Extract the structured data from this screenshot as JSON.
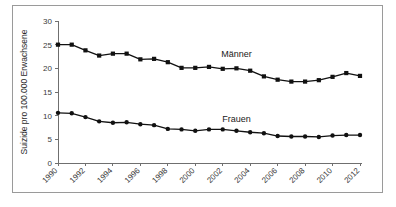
{
  "figure": {
    "background_color": "#ffffff",
    "frame_color": "#9a9a9a",
    "series_color": "#111111"
  },
  "chart_data": {
    "type": "line",
    "title": "",
    "subtitle": "",
    "xlabel": "",
    "ylabel": "Suizide pro 100.000 Erwachsene",
    "ylim": [
      0,
      30
    ],
    "yticks": [
      0,
      5,
      10,
      15,
      20,
      25,
      30
    ],
    "ytick_labels": [
      "0",
      "5",
      "10",
      "15",
      "20",
      "25",
      "30"
    ],
    "grid": false,
    "legend_position": "inline-annotation",
    "x": [
      1990,
      1991,
      1992,
      1993,
      1994,
      1995,
      1996,
      1997,
      1998,
      1999,
      2000,
      2001,
      2002,
      2003,
      2004,
      2005,
      2006,
      2007,
      2008,
      2009,
      2010,
      2011,
      2012
    ],
    "xtick_values": [
      1990,
      1992,
      1994,
      1996,
      1998,
      2000,
      2002,
      2004,
      2006,
      2008,
      2010,
      2012
    ],
    "xtick_labels": [
      "1990",
      "1992",
      "1994",
      "1996",
      "1998",
      "2000",
      "2002",
      "2004",
      "2006",
      "2008",
      "2010",
      "2012"
    ],
    "xlim": [
      1990,
      2012
    ],
    "series": [
      {
        "name": "Männer",
        "label": "Männer",
        "marker": "square",
        "color": "#111111",
        "annotation": "Männer",
        "values": [
          25.0,
          25.0,
          23.8,
          22.7,
          23.1,
          23.1,
          21.9,
          22.0,
          21.3,
          20.1,
          20.1,
          20.3,
          19.9,
          20.0,
          19.5,
          18.3,
          17.6,
          17.2,
          17.2,
          17.5,
          18.2,
          19.0,
          18.4
        ]
      },
      {
        "name": "Frauen",
        "label": "Frauen",
        "marker": "circle",
        "color": "#111111",
        "annotation": "Frauen",
        "values": [
          10.6,
          10.5,
          9.7,
          8.8,
          8.5,
          8.6,
          8.2,
          8.0,
          7.2,
          7.1,
          6.8,
          7.1,
          7.1,
          6.8,
          6.5,
          6.3,
          5.7,
          5.6,
          5.6,
          5.5,
          5.8,
          5.9,
          5.9
        ]
      }
    ],
    "annotations": [
      {
        "text": "Männer",
        "x": 2003,
        "y": 22.4
      },
      {
        "text": "Frauen",
        "x": 2003,
        "y": 8.6
      }
    ]
  }
}
